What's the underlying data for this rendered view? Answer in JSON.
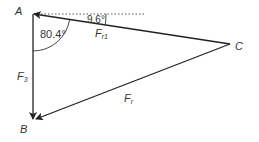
{
  "diagram": {
    "type": "force-triangle",
    "vertices": {
      "A": {
        "label": "A",
        "x": 33,
        "y": 14
      },
      "B": {
        "label": "B",
        "x": 33,
        "y": 120
      },
      "C": {
        "label": "C",
        "x": 230,
        "y": 44
      }
    },
    "vectors": [
      {
        "name": "F3",
        "label_main": "F",
        "label_sub": "3",
        "from": "A",
        "to": "B"
      },
      {
        "name": "Fr",
        "label_main": "F",
        "label_sub": "r",
        "from": "C",
        "to": "B"
      },
      {
        "name": "Fr1",
        "label_main": "F",
        "label_sub": "r1",
        "from": "C",
        "to": "A"
      }
    ],
    "angles": {
      "at_A_between_F3_and_Fr1": "80.4°",
      "between_horizontal_and_Fr1": "9.6°"
    },
    "reference_line": "horizontal dotted line through A",
    "colors": {
      "line": "#222222",
      "text": "#333333",
      "dotted": "#555555"
    }
  }
}
